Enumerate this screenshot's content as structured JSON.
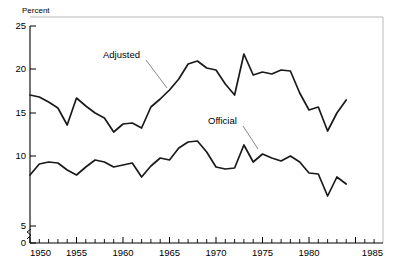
{
  "chart_data": {
    "type": "line",
    "title": "",
    "subtitle": "",
    "xlabel": "",
    "ylabel": "Percent",
    "ylabel_position": "top-left",
    "xlim": [
      1950,
      1985
    ],
    "ylim": [
      0,
      25
    ],
    "y_axis_break": {
      "from": 0,
      "to": 5,
      "symbol": "squiggle"
    },
    "grid": false,
    "legend": "inline-annotations",
    "y_ticks": [
      0,
      5,
      10,
      15,
      20,
      25
    ],
    "y_tick_labels": [
      "0",
      "5",
      "10",
      "15",
      "20",
      "25"
    ],
    "x_ticks": [
      1950,
      1955,
      1960,
      1965,
      1970,
      1975,
      1980,
      1985
    ],
    "x_tick_labels": [
      "1950",
      "1955",
      "1960",
      "1965",
      "1970",
      "1975",
      "1980",
      "1985"
    ],
    "x_minor_tick_interval": 1,
    "x": [
      1950,
      1951,
      1952,
      1953,
      1954,
      1955,
      1956,
      1957,
      1958,
      1959,
      1960,
      1961,
      1962,
      1963,
      1964,
      1965,
      1966,
      1967,
      1968,
      1969,
      1970,
      1971,
      1972,
      1973,
      1974,
      1975,
      1976,
      1977,
      1978,
      1979,
      1980,
      1981,
      1982,
      1983,
      1984
    ],
    "series": [
      {
        "name": "Adjusted",
        "label": "Adjusted",
        "color": "#1a1a1a",
        "annotation": {
          "text": "Adjusted",
          "points_to_year": 1963
        },
        "values": [
          18.1,
          17.9,
          17.4,
          16.8,
          15.1,
          17.8,
          17.0,
          16.3,
          15.8,
          14.4,
          15.2,
          15.3,
          14.8,
          16.9,
          17.7,
          18.6,
          19.7,
          21.2,
          21.5,
          20.8,
          20.6,
          19.2,
          18.1,
          22.2,
          20.1,
          20.4,
          20.2,
          20.6,
          20.5,
          18.3,
          16.6,
          16.9,
          14.5,
          16.3,
          17.6
        ]
      },
      {
        "name": "Official",
        "label": "Official",
        "color": "#1a1a1a",
        "annotation": {
          "text": "Official",
          "points_to_year": 1974
        },
        "values": [
          10.1,
          11.2,
          11.4,
          11.3,
          10.6,
          10.1,
          10.9,
          11.6,
          11.4,
          10.9,
          11.1,
          11.3,
          9.9,
          11.0,
          11.8,
          11.6,
          12.8,
          13.4,
          13.5,
          12.4,
          10.9,
          10.7,
          10.8,
          13.1,
          11.4,
          12.2,
          11.8,
          11.5,
          12.0,
          11.4,
          10.3,
          10.2,
          8.0,
          9.9,
          9.2
        ]
      }
    ]
  },
  "axis": {
    "y_title": "Percent"
  },
  "annotations": {
    "adjusted_label": "Adjusted",
    "official_label": "Official"
  }
}
